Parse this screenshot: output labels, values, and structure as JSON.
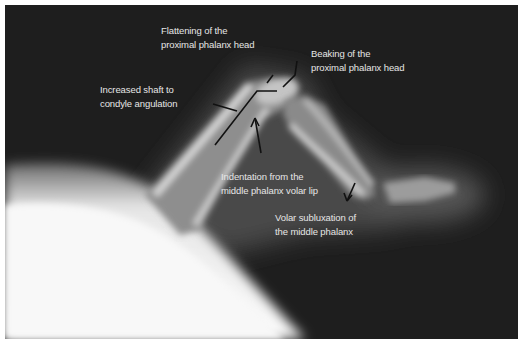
{
  "figure": {
    "type": "annotated radiograph",
    "annotations": [
      {
        "id": "flattening",
        "lines": [
          "Flattening of the",
          "proximal phalanx head"
        ]
      },
      {
        "id": "beaking",
        "lines": [
          "Beaking of the",
          "proximal phalanx head"
        ]
      },
      {
        "id": "angulation",
        "lines": [
          "Increased shaft to",
          "condyle angulation"
        ]
      },
      {
        "id": "indentation",
        "lines": [
          "Indentation from the",
          "middle phalanx volar lip"
        ]
      },
      {
        "id": "subluxation",
        "lines": [
          "Volar subluxation of",
          "the middle phalanx"
        ]
      }
    ],
    "colors": {
      "background": "#1e1e1e",
      "bone": "#c8c8c8",
      "soft_tissue": "#f4f4f4",
      "label_text": "#e6e6e6",
      "annotation_line": "#111111"
    }
  }
}
